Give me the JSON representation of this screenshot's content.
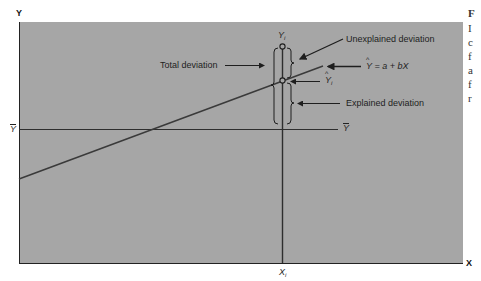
{
  "diagram": {
    "axes": {
      "x_label": "X",
      "y_label": "Y"
    },
    "labels": {
      "total_deviation": "Total deviation",
      "unexplained_deviation": "Unexplained deviation",
      "explained_deviation": "Explained deviation",
      "regression_equation": {
        "lhs": "Y",
        "rhs": "= a + bX"
      },
      "y_i": {
        "base": "Y",
        "sub": "i"
      },
      "y_hat_i": {
        "base": "Y",
        "sub": "i"
      },
      "y_bar_left": "Y",
      "y_bar_right": "Y",
      "x_i": {
        "base": "X",
        "sub": "i"
      }
    },
    "colors": {
      "background": "#ffffff",
      "panel": "#a6a6a6",
      "line": "#2e2e2e",
      "text": "#1e1e1e"
    },
    "side_text_fragments": [
      "F",
      "I",
      "c",
      "f",
      "a",
      "f",
      "r"
    ]
  }
}
